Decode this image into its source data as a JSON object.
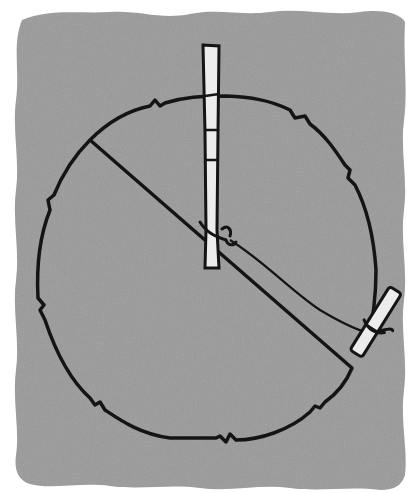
{
  "illustration": {
    "subject": "stake-and-string circle layout",
    "colors": {
      "page": "#ffffff",
      "ground": "#9a9a9a",
      "ink": "#141414",
      "stake": "#ececec"
    },
    "center_stake": {
      "x": 214,
      "y": 45,
      "width": 19,
      "height": 225
    },
    "outer_stake": {
      "x": 372,
      "y": 345,
      "angle_deg": 30
    },
    "circle": {
      "cx": 205,
      "cy": 270,
      "rx": 168,
      "ry": 178
    }
  }
}
